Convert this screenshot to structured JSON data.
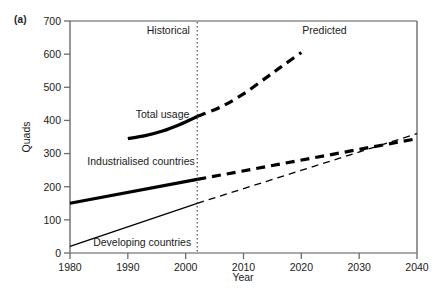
{
  "panel": {
    "label": "(a)"
  },
  "chart_data": {
    "type": "line",
    "title": "",
    "xlabel": "Year",
    "ylabel": "Quads",
    "xlim": [
      1980,
      2040
    ],
    "ylim": [
      0,
      700
    ],
    "grid": false,
    "legend": "inline-labels",
    "x_ticks": [
      1980,
      1990,
      2000,
      2010,
      2020,
      2030,
      2040
    ],
    "y_ticks": [
      0,
      100,
      200,
      300,
      400,
      500,
      600,
      700
    ],
    "divider": {
      "x": 2002,
      "style": "dotted",
      "label_left": "Historical",
      "label_right": "Predicted"
    },
    "annotations": [
      {
        "text": "Historical",
        "x": 1997,
        "y": 660
      },
      {
        "text": "Predicted",
        "x": 2024,
        "y": 660
      },
      {
        "text": "Total usage",
        "x": 1996,
        "y": 408
      },
      {
        "text": "Industrialised countries",
        "x": 1983,
        "y": 265
      },
      {
        "text": "Developing countries",
        "x": 1984,
        "y": 22
      }
    ],
    "series": [
      {
        "name": "Total usage",
        "label": "Total usage",
        "color": "#000000",
        "width": 3.2,
        "historical": {
          "style": "solid",
          "x": [
            1990,
            1993,
            1996,
            1999,
            2002
          ],
          "values": [
            345,
            354,
            368,
            388,
            412
          ]
        },
        "predicted": {
          "style": "dashed",
          "x": [
            2002,
            2006,
            2010,
            2014,
            2017,
            2020
          ],
          "values": [
            412,
            440,
            480,
            530,
            568,
            605
          ]
        }
      },
      {
        "name": "Industrialised countries",
        "label": "Industrialised countries",
        "color": "#000000",
        "width": 3.2,
        "historical": {
          "style": "solid",
          "x": [
            1980,
            2002
          ],
          "values": [
            150,
            222
          ]
        },
        "predicted": {
          "style": "dashed",
          "x": [
            2002,
            2040
          ],
          "values": [
            222,
            345
          ]
        }
      },
      {
        "name": "Developing countries",
        "label": "Developing countries",
        "color": "#000000",
        "width": 1.3,
        "historical": {
          "style": "solid",
          "x": [
            1980,
            2002
          ],
          "values": [
            20,
            150
          ]
        },
        "predicted": {
          "style": "dashed",
          "x": [
            2002,
            2040
          ],
          "values": [
            150,
            360
          ]
        }
      }
    ]
  },
  "axes": {
    "x_tick_labels": [
      "1980",
      "1990",
      "2000",
      "2010",
      "2020",
      "2030",
      "2040"
    ],
    "y_tick_labels": [
      "0",
      "100",
      "200",
      "300",
      "400",
      "500",
      "600",
      "700"
    ],
    "x_title": "Year",
    "y_title": "Quads"
  },
  "colors": {
    "ink": "#1a1a1a",
    "line": "#000000",
    "axis": "#808080",
    "divider": "#4d4d4d",
    "background": "#ffffff"
  }
}
